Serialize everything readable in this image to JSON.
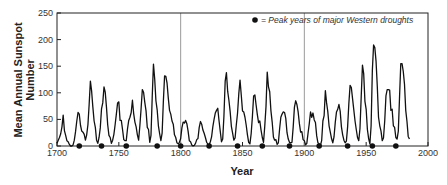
{
  "chart_data": {
    "type": "line",
    "title": "",
    "xlabel": "Year",
    "ylabel_lines": [
      "Mean Annual Sunspot",
      "Number"
    ],
    "xlim": [
      1700,
      2000
    ],
    "ylim": [
      0,
      250
    ],
    "x_ticks": [
      1700,
      1750,
      1800,
      1850,
      1900,
      1950,
      2000
    ],
    "y_ticks": [
      0,
      50,
      100,
      150,
      200,
      250
    ],
    "reference_lines_x": [
      1800,
      1900
    ],
    "legend": {
      "marker": "filled-circle",
      "label": "= Peak years of major Western droughts",
      "position": "top-right"
    },
    "drought_peak_years": [
      1718,
      1736,
      1756,
      1781,
      1800,
      1823,
      1846,
      1866,
      1888,
      1912,
      1935,
      1955,
      1974
    ],
    "series": [
      {
        "name": "Mean annual sunspot number",
        "x_start": 1700,
        "x_step": 1,
        "values": [
          5,
          11,
          16,
          23,
          36,
          58,
          29,
          20,
          10,
          8,
          3,
          0,
          0,
          2,
          11,
          27,
          47,
          63,
          60,
          39,
          28,
          26,
          22,
          11,
          21,
          40,
          78,
          122,
          103,
          73,
          47,
          35,
          11,
          5,
          16,
          34,
          70,
          81,
          111,
          101,
          73,
          40,
          20,
          16,
          5,
          11,
          22,
          40,
          60,
          81,
          83,
          48,
          48,
          31,
          12,
          10,
          10,
          32,
          48,
          54,
          63,
          86,
          61,
          45,
          36,
          21,
          11,
          38,
          70,
          106,
          101,
          82,
          66,
          35,
          31,
          7,
          20,
          92,
          154,
          126,
          85,
          68,
          38,
          23,
          10,
          24,
          83,
          132,
          131,
          118,
          90,
          67,
          60,
          47,
          41,
          21,
          16,
          6,
          4,
          7,
          14,
          34,
          45,
          43,
          48,
          42,
          28,
          10,
          8,
          2,
          0,
          1,
          5,
          12,
          14,
          35,
          46,
          41,
          30,
          24,
          16,
          7,
          4,
          2,
          8,
          17,
          36,
          50,
          62,
          67,
          71,
          48,
          28,
          8,
          13,
          57,
          122,
          138,
          103,
          86,
          65,
          37,
          24,
          11,
          15,
          40,
          62,
          98,
          124,
          96,
          66,
          64,
          54,
          39,
          21,
          7,
          4,
          23,
          55,
          94,
          96,
          77,
          59,
          44,
          47,
          30,
          16,
          7,
          37,
          74,
          139,
          111,
          102,
          66,
          45,
          17,
          11,
          12,
          3,
          6,
          32,
          54,
          60,
          64,
          63,
          52,
          25,
          13,
          7,
          6,
          7,
          36,
          73,
          85,
          78,
          64,
          42,
          26,
          27,
          12,
          10,
          2,
          5,
          24,
          42,
          64,
          54,
          62,
          49,
          44,
          19,
          6,
          4,
          1,
          10,
          47,
          57,
          104,
          81,
          64,
          38,
          26,
          14,
          6,
          17,
          44,
          64,
          69,
          78,
          65,
          36,
          21,
          11,
          6,
          9,
          36,
          80,
          114,
          110,
          89,
          68,
          47,
          31,
          16,
          10,
          33,
          93,
          152,
          136,
          84,
          69,
          31,
          14,
          4,
          38,
          142,
          190,
          185,
          159,
          112,
          54,
          38,
          28,
          10,
          15,
          47,
          94,
          106,
          106,
          105,
          67,
          69,
          38,
          35,
          16,
          13,
          28,
          93,
          155,
          155,
          140,
          116,
          67,
          46,
          18,
          13
        ]
      }
    ]
  },
  "labels": {
    "ylabel_line1": "Mean Annual Sunspot",
    "ylabel_line2": "Number",
    "xlabel": "Year",
    "legend_text": "= Peak years of major Western droughts"
  },
  "style": {
    "line_color": "#111111",
    "axis_color": "#222222",
    "reference_line_color": "#9a9a9a",
    "marker_color": "#111111"
  }
}
